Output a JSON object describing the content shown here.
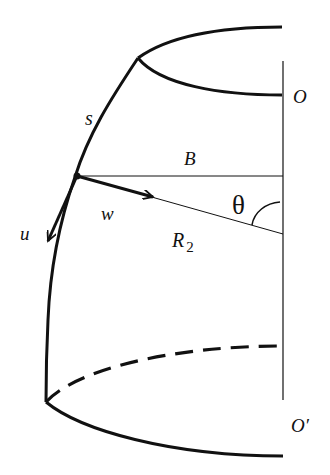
{
  "diagram": {
    "title": "",
    "labels": {
      "s": "s",
      "O": "O",
      "O_prime": "O′",
      "B": "B",
      "theta": "θ",
      "w": "w",
      "u": "u",
      "R": "R",
      "R_sub": "2"
    },
    "colors": {
      "stroke": "#111111",
      "background": "#ffffff"
    }
  }
}
